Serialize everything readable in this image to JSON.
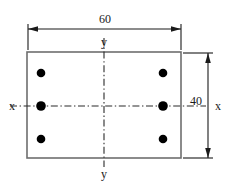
{
  "diagram": {
    "type": "reinforced-concrete-section",
    "background_color": "#ffffff",
    "outline_color": "#6e6e6e",
    "rebar_color": "#000000",
    "centerline_color": "#2b2b2b",
    "dimension_color": "#1a1a1a"
  },
  "dimensions": {
    "width": {
      "value": "60",
      "orientation": "horizontal",
      "position": "top"
    },
    "height": {
      "value": "40",
      "orientation": "vertical",
      "position": "right"
    }
  },
  "axes": {
    "horizontal": {
      "label_left": "x",
      "label_right": "x",
      "style": "dash-dot"
    },
    "vertical": {
      "label_top": "y",
      "label_bottom": "y",
      "style": "dash-dot"
    }
  },
  "rebars": {
    "count": 6,
    "columns": 2,
    "rows": 3,
    "items": [
      {
        "id": "bar-top-left",
        "cx": 41,
        "cy": 73,
        "r": 4.3
      },
      {
        "id": "bar-top-right",
        "cx": 163,
        "cy": 73,
        "r": 4.3
      },
      {
        "id": "bar-mid-left",
        "cx": 41,
        "cy": 106,
        "r": 4.8
      },
      {
        "id": "bar-mid-right",
        "cx": 163,
        "cy": 106,
        "r": 4.8
      },
      {
        "id": "bar-bot-left",
        "cx": 41,
        "cy": 139,
        "r": 4.3
      },
      {
        "id": "bar-bot-right",
        "cx": 163,
        "cy": 139,
        "r": 4.3
      }
    ]
  },
  "section": {
    "x": 27,
    "y": 52,
    "width": 154,
    "height": 106
  }
}
